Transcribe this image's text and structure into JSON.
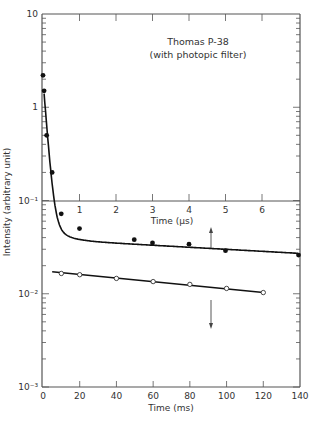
{
  "chart_data": {
    "type": "scatter",
    "title": "Thomas P-38",
    "subtitle": "(with photopic filter)",
    "ylabel": "Intensity (arbitrary unit)",
    "xlabel": "Time (ms)",
    "xlabel_inner": "Time (μs)",
    "yscale": "log",
    "ylim": [
      0.001,
      10
    ],
    "xlim": [
      0,
      140
    ],
    "xlim_inner": [
      0,
      7
    ],
    "grid": false,
    "legend": "none",
    "x_ticks": [
      "0",
      "20",
      "40",
      "60",
      "80",
      "100",
      "120",
      "140"
    ],
    "x_inner_ticks": [
      "1",
      "2",
      "3",
      "4",
      "5",
      "6"
    ],
    "y_ticks": [
      "10",
      "1",
      "10⁻¹",
      "10⁻²",
      "10⁻³"
    ],
    "series": [
      {
        "name": "Fast decay (μs axis, filled circles, arrow up)",
        "marker": "filled-circle",
        "x_axis": "us",
        "x": [
          0,
          0.03,
          0.1,
          0.25,
          0.5,
          1,
          2.5,
          3,
          4,
          5,
          7
        ],
        "values": [
          2.2,
          1.5,
          0.5,
          0.2,
          0.072,
          0.05,
          0.038,
          0.035,
          0.034,
          0.029,
          0.026
        ]
      },
      {
        "name": "Slow decay (ms axis, open circles, arrow down)",
        "marker": "open-circle",
        "x_axis": "ms",
        "x": [
          10,
          20,
          40,
          60,
          80,
          100,
          120
        ],
        "values": [
          0.0165,
          0.016,
          0.0146,
          0.0135,
          0.0126,
          0.0114,
          0.0103
        ]
      }
    ],
    "annotations": [
      {
        "type": "arrow-up",
        "x_ms": 92,
        "meaning": "upper curve read on μs axis"
      },
      {
        "type": "arrow-down",
        "x_ms": 92,
        "meaning": "lower curve read on ms axis"
      }
    ]
  }
}
